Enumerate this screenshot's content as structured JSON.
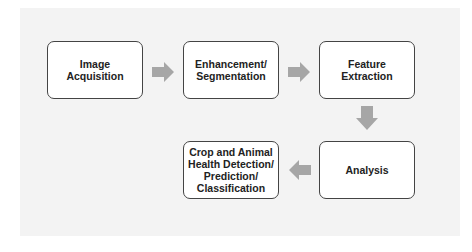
{
  "diagram": {
    "type": "flowchart",
    "nodes": [
      {
        "id": "n1",
        "label": "Image Acquisition"
      },
      {
        "id": "n2",
        "label": "Enhancement/\nSegmentation"
      },
      {
        "id": "n3",
        "label": "Feature Extraction"
      },
      {
        "id": "n4",
        "label": "Analysis"
      },
      {
        "id": "n5",
        "label": "Crop and Animal\nHealth Detection/\nPrediction/\nClassification"
      }
    ],
    "edges": [
      {
        "from": "n1",
        "to": "n2",
        "direction": "right"
      },
      {
        "from": "n2",
        "to": "n3",
        "direction": "right"
      },
      {
        "from": "n3",
        "to": "n4",
        "direction": "down"
      },
      {
        "from": "n4",
        "to": "n5",
        "direction": "left"
      }
    ],
    "colors": {
      "arrow": "#a6a6a6",
      "box_border": "#444444",
      "box_fill": "#ffffff",
      "background": "#f3f3f3"
    }
  }
}
